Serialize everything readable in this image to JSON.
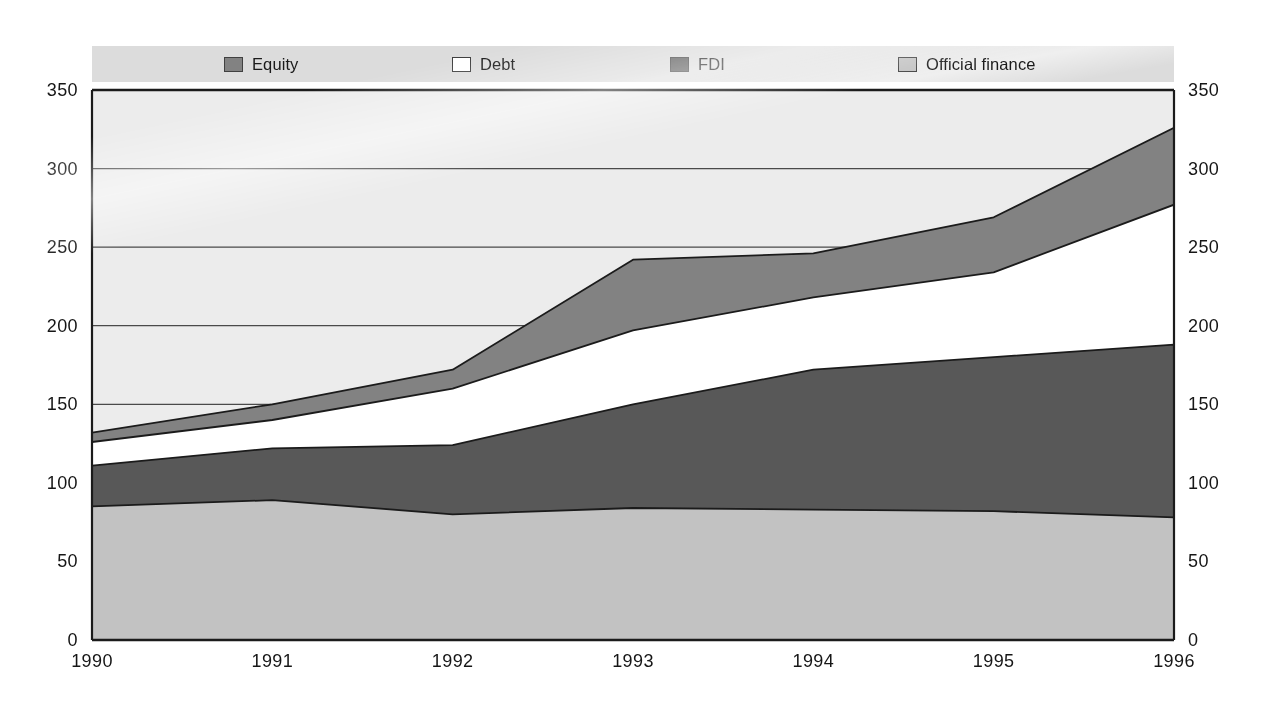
{
  "figure": {
    "plot_background": "#ececec",
    "axis_color": "#1b1b1b",
    "gridline_color": "#4a4a4a"
  },
  "legend": {
    "background": "#dcdcdc",
    "items": [
      {
        "label": "Equity",
        "color": "#828282"
      },
      {
        "label": "Debt",
        "color": "#ffffff"
      },
      {
        "label": "FDI",
        "color": "#585858"
      },
      {
        "label": "Official finance",
        "color": "#c2c2c2"
      }
    ]
  },
  "axes": {
    "y_left_ticks": [
      "350",
      "300",
      "250",
      "200",
      "150",
      "100",
      "50",
      "0"
    ],
    "y_right_ticks": [
      "350",
      "300",
      "250",
      "200",
      "150",
      "100",
      "50",
      "0"
    ],
    "x_ticks": [
      "1990",
      "1991",
      "1992",
      "1993",
      "1994",
      "1995",
      "1996"
    ]
  },
  "chart_data": {
    "type": "area",
    "title": "",
    "xlabel": "",
    "ylabel": "",
    "stacked": true,
    "x": [
      1990,
      1991,
      1992,
      1993,
      1994,
      1995,
      1996
    ],
    "categories": [
      "1990",
      "1991",
      "1992",
      "1993",
      "1994",
      "1995",
      "1996"
    ],
    "series": [
      {
        "name": "Official finance",
        "color": "#c2c2c2",
        "values": [
          85,
          89,
          80,
          84,
          83,
          82,
          78
        ]
      },
      {
        "name": "FDI",
        "color": "#585858",
        "values": [
          26,
          33,
          44,
          66,
          89,
          98,
          110
        ]
      },
      {
        "name": "Debt",
        "color": "#ffffff",
        "values": [
          15,
          18,
          36,
          47,
          46,
          54,
          89
        ]
      },
      {
        "name": "Equity",
        "color": "#828282",
        "values": [
          6,
          10,
          12,
          45,
          28,
          35,
          49
        ]
      }
    ],
    "cumulative_tops": {
      "official_finance": [
        85,
        89,
        80,
        84,
        83,
        82,
        78
      ],
      "fdi": [
        111,
        122,
        124,
        150,
        172,
        180,
        188
      ],
      "debt": [
        126,
        140,
        160,
        197,
        218,
        234,
        277
      ],
      "equity": [
        132,
        150,
        172,
        242,
        246,
        269,
        326
      ]
    },
    "ylim": [
      0,
      350
    ],
    "ytick_step": 50,
    "grid": true,
    "legend_position": "top"
  }
}
